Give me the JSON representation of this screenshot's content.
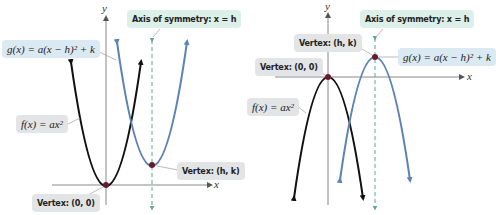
{
  "colors": {
    "f_curve": "#111111",
    "g_curve": "#5b83b3",
    "axis_of_symmetry": "#5aa890",
    "axes": "#777777",
    "vertex_dot": "#6b1a2e"
  },
  "left_graph": {
    "x_axis_label": "x",
    "y_axis_label": "y",
    "axis_of_symmetry_label": "Axis of symmetry: x = h",
    "g_label": "g(x) = a(x − h)² + k",
    "f_label": "f(x) = ax²",
    "vertex_hk_label": "Vertex: (h, k)",
    "vertex_origin_label": "Vertex: (0, 0)",
    "orientation": "opens upward"
  },
  "right_graph": {
    "x_axis_label": "x",
    "y_axis_label": "y",
    "axis_of_symmetry_label": "Axis of symmetry: x = h",
    "g_label": "g(x) = a(x − h)² + k",
    "f_label": "f(x) = ax²",
    "vertex_hk_label": "Vertex: (h, k)",
    "vertex_origin_label": "Vertex: (0, 0)",
    "orientation": "opens downward"
  }
}
